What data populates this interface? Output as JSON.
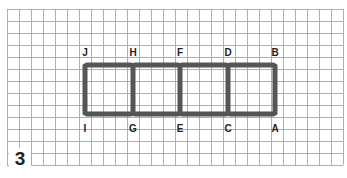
{
  "puzzle": {
    "number": "3",
    "grid": {
      "x0": 7,
      "y0": 9,
      "cell": 12,
      "cols": 28,
      "rows": 13,
      "color": "#9a9a9a"
    },
    "stick_color": "#555555",
    "squares": 4,
    "top_labels": [
      {
        "text": "J",
        "x": 85
      },
      {
        "text": "H",
        "x": 133
      },
      {
        "text": "F",
        "x": 180
      },
      {
        "text": "D",
        "x": 228
      },
      {
        "text": "B",
        "x": 275
      }
    ],
    "bottom_labels": [
      {
        "text": "I",
        "x": 85
      },
      {
        "text": "G",
        "x": 133
      },
      {
        "text": "E",
        "x": 180
      },
      {
        "text": "C",
        "x": 228
      },
      {
        "text": "A",
        "x": 275
      }
    ]
  }
}
